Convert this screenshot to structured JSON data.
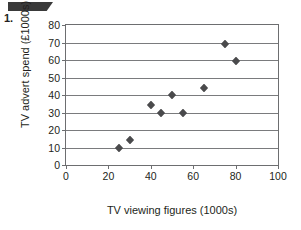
{
  "page": {
    "question_number": "1.",
    "redaction_banner": "redacted-black-ribbon"
  },
  "chart_data": {
    "type": "scatter",
    "title": "",
    "xlabel": "TV viewing figures (1000s)",
    "ylabel": "TV advert spend (£1000s)",
    "xlim": [
      0,
      100
    ],
    "ylim": [
      0,
      80
    ],
    "xticks": [
      0,
      20,
      40,
      60,
      80,
      100
    ],
    "yticks": [
      0,
      10,
      20,
      30,
      40,
      50,
      60,
      70,
      80
    ],
    "xtick_labels": [
      "0",
      "20",
      "40",
      "60",
      "80",
      "100"
    ],
    "ytick_labels": [
      "0",
      "10",
      "20",
      "30",
      "40",
      "50",
      "60",
      "70",
      "80"
    ],
    "grid": "horizontal",
    "legend": "none",
    "marker": "diamond",
    "marker_color": "#4a4a4c",
    "grid_color": "#7a7b7d",
    "axis_color": "#6d6e70",
    "points": [
      {
        "x": 25,
        "y": 10
      },
      {
        "x": 30,
        "y": 14.5
      },
      {
        "x": 40,
        "y": 34.5
      },
      {
        "x": 45,
        "y": 30
      },
      {
        "x": 50,
        "y": 40
      },
      {
        "x": 55,
        "y": 30
      },
      {
        "x": 65,
        "y": 44
      },
      {
        "x": 75,
        "y": 69
      },
      {
        "x": 80,
        "y": 59.5
      }
    ]
  }
}
